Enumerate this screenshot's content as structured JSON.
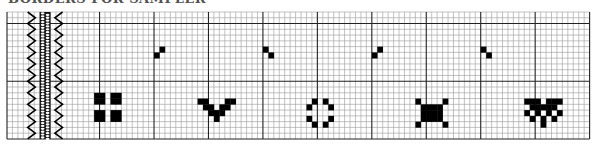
{
  "title": "BORDERS FOR SAMPLER",
  "grid": {
    "origin_x": 7,
    "origin_y": 12,
    "cell_w": 5.445,
    "cell_h": 5.77,
    "cols": 107,
    "rows": 22,
    "major_every": 10,
    "major_col_offset": 7,
    "major_row_offset": 2,
    "minor_color": "#9a9a9a",
    "major_color": "#222222",
    "fill_color": "#000000"
  },
  "border_band": {
    "left_zigzag_col": 4.5,
    "braid_cols": [
      6,
      8
    ],
    "right_zigzag_col": 9.5
  },
  "motifs": [
    {
      "name": "diagonal-pair-1",
      "cells": [
        [
          27,
          7
        ],
        [
          28,
          6
        ]
      ]
    },
    {
      "name": "diagonal-pair-2",
      "cells": [
        [
          47,
          6
        ],
        [
          48,
          7
        ]
      ]
    },
    {
      "name": "diagonal-pair-3",
      "cells": [
        [
          67,
          7
        ],
        [
          68,
          6
        ]
      ]
    },
    {
      "name": "diagonal-pair-4",
      "cells": [
        [
          87,
          6
        ],
        [
          88,
          7
        ]
      ]
    },
    {
      "name": "four-squares",
      "cells": [
        [
          16,
          14
        ],
        [
          17,
          14
        ],
        [
          16,
          15
        ],
        [
          17,
          15
        ],
        [
          19,
          14
        ],
        [
          20,
          14
        ],
        [
          19,
          15
        ],
        [
          20,
          15
        ],
        [
          16,
          17
        ],
        [
          17,
          17
        ],
        [
          16,
          18
        ],
        [
          17,
          18
        ],
        [
          19,
          17
        ],
        [
          20,
          17
        ],
        [
          19,
          18
        ],
        [
          20,
          18
        ]
      ]
    },
    {
      "name": "chevron-v",
      "cells": [
        [
          35,
          15
        ],
        [
          36,
          15
        ],
        [
          36,
          16
        ],
        [
          37,
          16
        ],
        [
          37,
          17
        ],
        [
          38,
          17
        ],
        [
          38,
          18
        ],
        [
          39,
          17
        ],
        [
          39,
          16
        ],
        [
          40,
          16
        ],
        [
          40,
          15
        ],
        [
          41,
          15
        ]
      ]
    },
    {
      "name": "ring",
      "cells": [
        [
          56,
          15
        ],
        [
          58,
          15
        ],
        [
          55,
          16
        ],
        [
          59,
          16
        ],
        [
          55,
          18
        ],
        [
          59,
          18
        ],
        [
          56,
          19
        ],
        [
          58,
          19
        ]
      ]
    },
    {
      "name": "square-with-corners",
      "cells": [
        [
          75,
          15
        ],
        [
          80,
          15
        ],
        [
          76,
          16
        ],
        [
          77,
          16
        ],
        [
          78,
          16
        ],
        [
          79,
          16
        ],
        [
          76,
          17
        ],
        [
          77,
          17
        ],
        [
          78,
          17
        ],
        [
          79,
          17
        ],
        [
          76,
          18
        ],
        [
          77,
          18
        ],
        [
          78,
          18
        ],
        [
          79,
          18
        ],
        [
          75,
          19
        ],
        [
          80,
          19
        ]
      ]
    },
    {
      "name": "heart",
      "cells": [
        [
          95,
          15
        ],
        [
          96,
          15
        ],
        [
          97,
          15
        ],
        [
          99,
          15
        ],
        [
          100,
          15
        ],
        [
          101,
          15
        ],
        [
          96,
          16
        ],
        [
          97,
          16
        ],
        [
          98,
          16
        ],
        [
          99,
          16
        ],
        [
          100,
          16
        ],
        [
          95,
          17
        ],
        [
          97,
          17
        ],
        [
          99,
          17
        ],
        [
          101,
          17
        ],
        [
          96,
          18
        ],
        [
          98,
          18
        ],
        [
          100,
          18
        ],
        [
          98,
          19
        ]
      ]
    }
  ]
}
